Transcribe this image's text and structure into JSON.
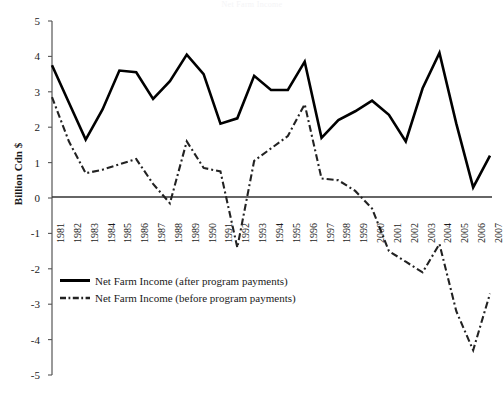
{
  "chart_data": {
    "type": "line",
    "title": "Net Farm Income",
    "xlabel": "",
    "ylabel": "Billion Cdn $",
    "ylim": [
      -5,
      5
    ],
    "yticks": [
      5,
      4,
      3,
      2,
      1,
      0,
      -1,
      -2,
      -3,
      -4,
      -5
    ],
    "ytick_labels": [
      "5",
      "4",
      "3",
      "2",
      "1",
      "0",
      "-1",
      "-2",
      "-3",
      "-4",
      "-5"
    ],
    "grid": false,
    "legend_position": "lower-left",
    "categories": [
      "1981",
      "1982",
      "1983",
      "1984",
      "1985",
      "1986",
      "1987",
      "1988",
      "1989",
      "1990",
      "1991",
      "1992",
      "1993",
      "1994",
      "1995",
      "1996",
      "1997",
      "1998",
      "1999",
      "2000",
      "2001",
      "2002",
      "2003",
      "2004",
      "2005",
      "2006",
      "2007"
    ],
    "series": [
      {
        "name": "Net Farm Income (after program payments)",
        "style": "solid",
        "color": "#000000",
        "values": [
          3.75,
          2.7,
          1.65,
          2.5,
          3.6,
          3.55,
          2.8,
          3.3,
          4.05,
          3.5,
          2.1,
          2.25,
          3.45,
          3.05,
          3.05,
          3.85,
          1.7,
          2.2,
          2.45,
          2.75,
          2.35,
          1.6,
          3.1,
          4.1,
          2.1,
          0.3,
          1.2
        ]
      },
      {
        "name": "Net Farm Income (before program payments)",
        "style": "dash-dot",
        "color": "#000000",
        "values": [
          2.85,
          1.6,
          0.7,
          0.8,
          0.95,
          1.1,
          0.4,
          -0.15,
          1.6,
          0.85,
          0.75,
          -1.4,
          1.05,
          1.4,
          1.75,
          2.65,
          0.55,
          0.5,
          0.2,
          -0.3,
          -1.5,
          -1.8,
          -2.1,
          -1.3,
          -3.2,
          -4.3,
          -2.7
        ]
      }
    ]
  },
  "legend": {
    "items": [
      {
        "label": "Net Farm Income (after program payments)",
        "style": "solid"
      },
      {
        "label": "Net Farm Income (before program payments)",
        "style": "dash-dot"
      }
    ]
  }
}
